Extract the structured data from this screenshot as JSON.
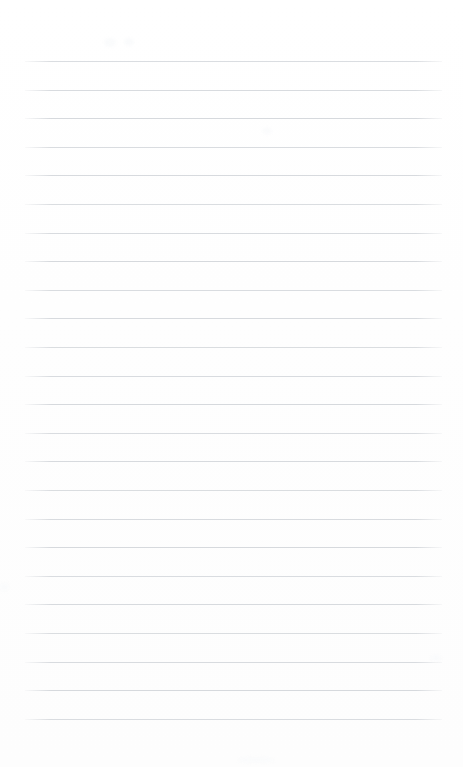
{
  "document": {
    "kind": "blank-ruled-notebook-page",
    "title": "",
    "body_text": "",
    "page_number": "",
    "header_text": "",
    "footer_text": ""
  },
  "paper": {
    "background_color": "#ffffff",
    "width_px": 463,
    "height_px": 767
  },
  "rules": {
    "line_color": "#d6d9dd",
    "line_thickness_px": 1,
    "line_start_x_px": 25,
    "line_end_x_px": 442,
    "first_line_y_px": 61,
    "line_spacing_px": 28.6,
    "line_count": 24,
    "y_positions": [
      61,
      89.6,
      118.2,
      146.8,
      175.4,
      204,
      232.6,
      261.2,
      289.8,
      318.4,
      347,
      375.6,
      404.2,
      432.8,
      461.4,
      490,
      518.6,
      547.2,
      575.8,
      604.4,
      633,
      661.6,
      690.2,
      718.8
    ]
  },
  "artifacts": {
    "smudges": [
      {
        "name": "smudge-top",
        "x": 104,
        "y": 38,
        "w": 12,
        "h": 9
      },
      {
        "name": "smudge-top-2",
        "x": 124,
        "y": 38,
        "w": 10,
        "h": 8
      },
      {
        "name": "smudge-mid",
        "x": 262,
        "y": 128,
        "w": 10,
        "h": 6
      },
      {
        "name": "smudge-left",
        "x": 0,
        "y": 583,
        "w": 9,
        "h": 8
      },
      {
        "name": "smudge-lower",
        "x": 238,
        "y": 757,
        "w": 36,
        "h": 6
      },
      {
        "name": "smudge-right",
        "x": 430,
        "y": 655,
        "w": 12,
        "h": 6
      }
    ]
  }
}
